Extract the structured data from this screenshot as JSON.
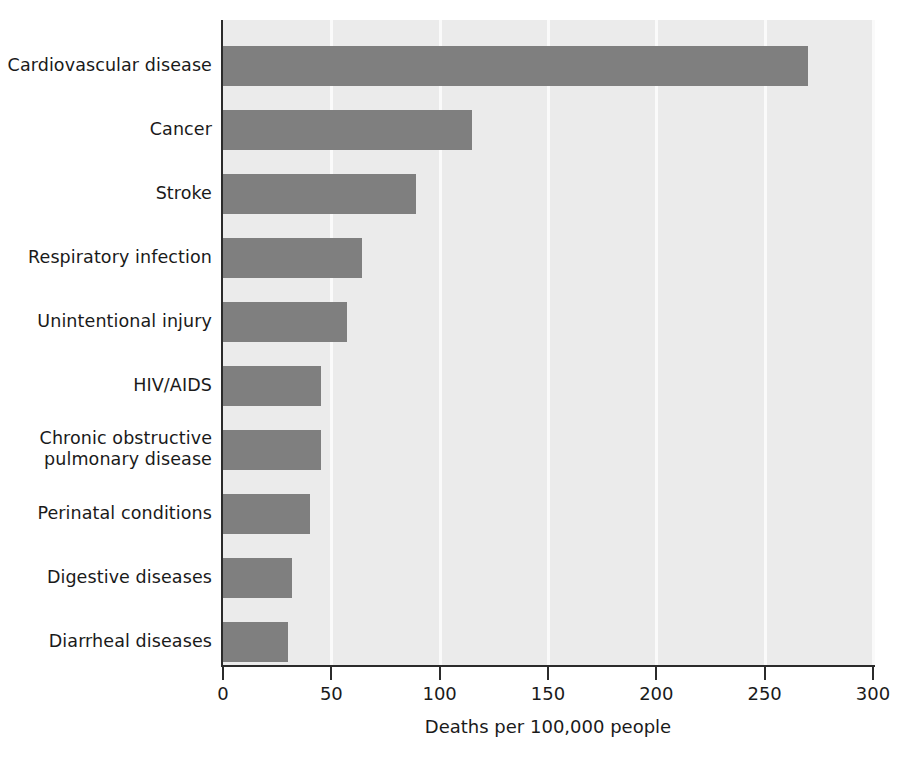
{
  "chart_data": {
    "type": "bar",
    "orientation": "horizontal",
    "title": "",
    "xlabel": "Deaths per 100,000 people",
    "ylabel": "",
    "xlim": [
      0,
      300
    ],
    "xticks": [
      0,
      50,
      100,
      150,
      200,
      250,
      300
    ],
    "xtick_labels": [
      "0",
      "50",
      "100",
      "150",
      "200",
      "250",
      "300"
    ],
    "grid": "vertical gridlines at each x tick, white on light-gray plot background",
    "legend": "none",
    "categories": [
      "Cardiovascular disease",
      "Cancer",
      "Stroke",
      "Respiratory infection",
      "Unintentional injury",
      "HIV/AIDS",
      "Chronic obstructive\npulmonary disease",
      "Perinatal conditions",
      "Digestive diseases",
      "Diarrheal diseases"
    ],
    "values": [
      270,
      115,
      89,
      64,
      57,
      45,
      45,
      40,
      32,
      30
    ],
    "bar_color": "#7f7f7f",
    "plot_background": "#ebebeb",
    "axis_color": "#2b2b2b",
    "gridline_color": "#fafafa"
  },
  "axis": {
    "x_title": "Deaths per 100,000 people"
  }
}
